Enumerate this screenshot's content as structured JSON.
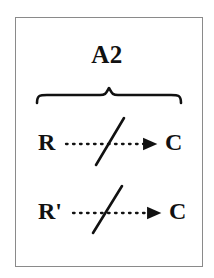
{
  "figure": {
    "title": "A2",
    "background_color": "#ffffff",
    "stroke_color": "#111111",
    "frame_color": "#8a8a8a",
    "group_brace": {
      "icon": "horizontal-curly-brace-icon",
      "label": "A2",
      "span_start_x": 37,
      "span_end_x": 181,
      "peak_x": 109,
      "y": 96
    },
    "relations": [
      {
        "id": "relation-1",
        "source": "R",
        "target": "C",
        "edge_style": "dotted",
        "edge_arrow": "filled-triangle",
        "negated": true,
        "negation_mark": "slash"
      },
      {
        "id": "relation-2",
        "source": "R'",
        "target": "C",
        "edge_style": "dotted",
        "edge_arrow": "filled-triangle",
        "negated": true,
        "negation_mark": "slash"
      }
    ]
  }
}
